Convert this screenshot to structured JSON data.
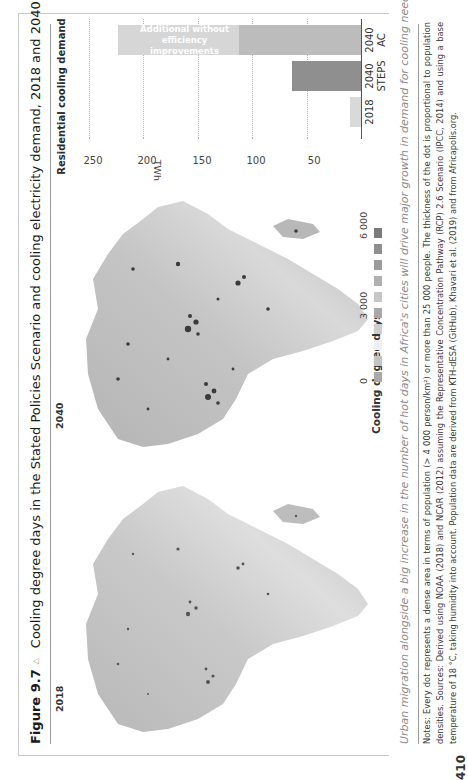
{
  "page": {
    "page_number": "410"
  },
  "figure": {
    "number": "Figure 9.7",
    "marker_icon": "triangle-icon",
    "title": "Cooling degree days in the Stated Policies Scenario and cooling electricity demand, 2018 and 2040",
    "map_labels": [
      "2018",
      "2040"
    ],
    "caption": "Urban migration alongside a big increase in the number of hot days in Africa's cities will drive major growth in demand for cooling needs",
    "notes": "Notes: Every dot represents a dense area in terms of population (> 4 000 person/km²) or more than 25 000 people. The thickness of the dot is proportional to population densities. Sources: Derived using NOAA (2018) and NCAR (2012) assuming the Representative Concentration Pathway (RCP) 2.6 Scenario (IPCC, 2014) and using a base temperature of 18 °C, taking humidity into account. Population data are derived from KTH-dESA (GitHub), Khavari et al. (2019) and from Africapolis.org."
  },
  "legend": {
    "title": "Cooling degree days",
    "ticks": [
      "0",
      "3 000",
      "6 000"
    ],
    "tick_values": [
      0,
      3000,
      6000
    ],
    "swatch_colors": [
      "#a9a9a9",
      "#c4c4c4",
      "#efefef",
      "#cdcdcd",
      "#a8a8a8",
      "#c6c6c6",
      "#b0b0b0",
      "#9c9c9c",
      "#8e8e8e",
      "#7a7a7a"
    ]
  },
  "chart_data": {
    "type": "bar",
    "title": "Residential cooling demand",
    "ylabel": "TWh",
    "ylim": [
      0,
      250
    ],
    "yticks": [
      50,
      100,
      150,
      200,
      250
    ],
    "grid": true,
    "categories": [
      [
        "2018",
        ""
      ],
      [
        "2040",
        "STEPS"
      ],
      [
        "2040",
        "AC"
      ]
    ],
    "series": [
      {
        "name": "Residential cooling demand",
        "color": "#d9d9d9",
        "values": [
          10,
          null,
          null
        ]
      },
      {
        "name": "STEPS",
        "color": "#8f8f8f",
        "values": [
          null,
          63,
          null
        ]
      },
      {
        "name": "AC",
        "color": "#bcbcbc",
        "values": [
          null,
          null,
          112
        ]
      },
      {
        "name": "Additional without efficiency improvements",
        "color": "#d6d6d6",
        "values": [
          null,
          null,
          111
        ]
      }
    ],
    "annotation": "Additional without efficiency improvements"
  }
}
